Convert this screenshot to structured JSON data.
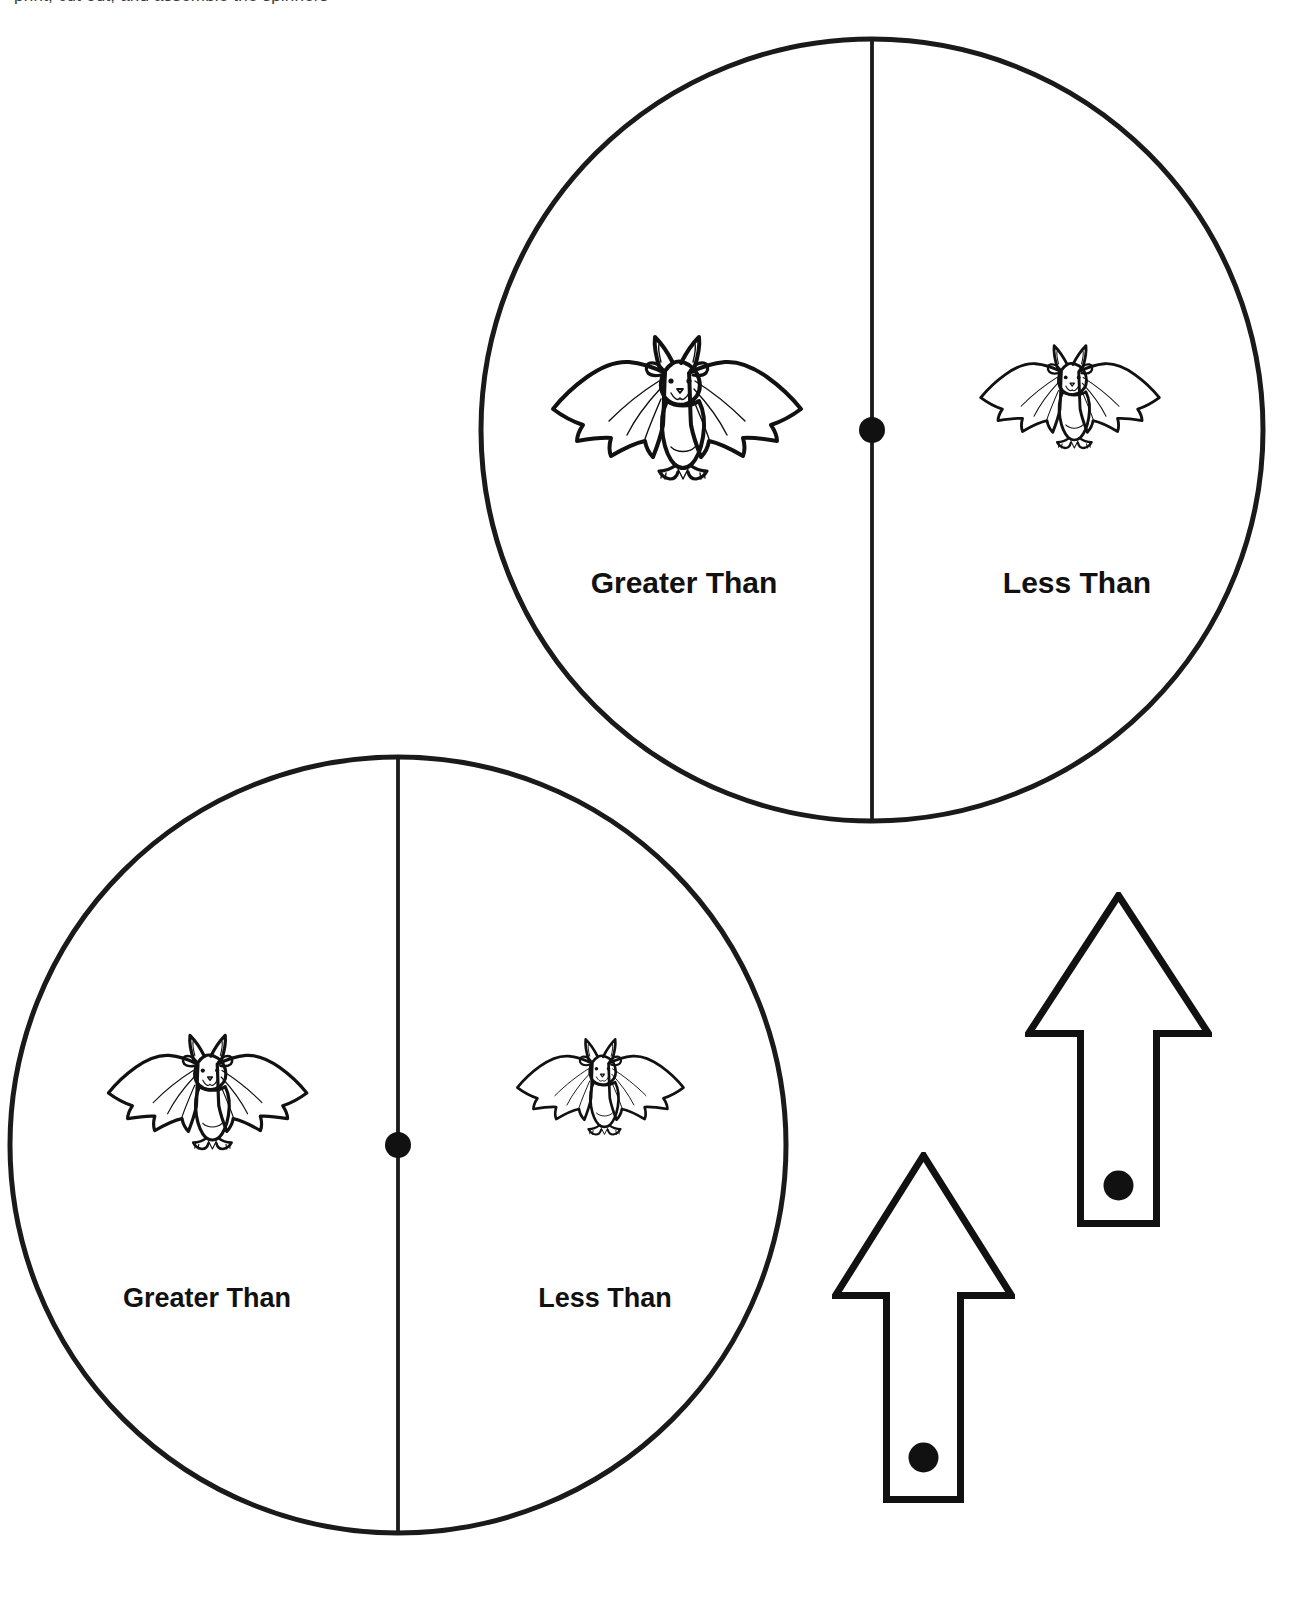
{
  "page": {
    "background_color": "#ffffff",
    "ink_color": "#111111",
    "width": 1306,
    "height": 1616,
    "clipped_instruction_line": "print, cut out, and assemble the spinners"
  },
  "spinners": [
    {
      "id": "spinner-top-right",
      "center_x": 872,
      "center_y": 430,
      "radius": 391,
      "stroke_width": 5,
      "hub_radius": 13,
      "label_font_size": 30,
      "label_y_offset": 155,
      "left": {
        "label": "Greater Than",
        "label_x_offset": -188,
        "icon": "bat-icon",
        "bat_scale": 1.0,
        "bat_x_offset": -195,
        "bat_y_offset": -25
      },
      "right": {
        "label": "Less Than",
        "label_x_offset": 205,
        "icon": "bat-icon",
        "bat_scale": 0.72,
        "bat_x_offset": 198,
        "bat_y_offset": -35
      }
    },
    {
      "id": "spinner-bottom-left",
      "center_x": 398,
      "center_y": 1145,
      "radius": 388,
      "stroke_width": 5,
      "hub_radius": 13,
      "label_font_size": 27,
      "label_y_offset": 155,
      "left": {
        "label": "Greater Than",
        "label_x_offset": -191,
        "icon": "bat-icon",
        "bat_scale": 0.8,
        "bat_x_offset": -190,
        "bat_y_offset": -55
      },
      "right": {
        "label": "Less Than",
        "label_x_offset": 207,
        "icon": "bat-icon",
        "bat_scale": 0.67,
        "bat_x_offset": 202,
        "bat_y_offset": -60
      }
    }
  ],
  "pointers": [
    {
      "id": "pointer-upper",
      "name": "arrow-spinner-pointer",
      "left": 1025,
      "top": 892,
      "width": 180,
      "height": 328,
      "stroke_width": 7,
      "head_half_width": 90,
      "head_height": 138,
      "shaft_half_width": 38,
      "pivot_dot_radius": 15,
      "pivot_dot_from_bottom": 38
    },
    {
      "id": "pointer-lower",
      "name": "arrow-spinner-pointer",
      "left": 832,
      "top": 1152,
      "width": 176,
      "height": 344,
      "stroke_width": 7,
      "head_half_width": 88,
      "head_height": 140,
      "shaft_half_width": 37,
      "pivot_dot_radius": 15,
      "pivot_dot_from_bottom": 42
    }
  ],
  "icons": {
    "bat": {
      "name": "bat-icon",
      "description": "cartoon bat with spread wings, pointed ears, smiling face and two feet"
    },
    "arrow": {
      "name": "up-arrow-icon",
      "description": "outlined upward pointing arrow with open rectangular shaft"
    },
    "hub": {
      "name": "spinner-hub-dot-icon",
      "description": "solid black pivot dot at the spinner center"
    }
  }
}
